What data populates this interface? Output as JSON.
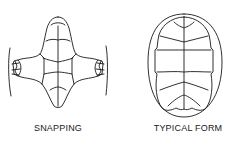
{
  "figure": {
    "panels": [
      {
        "id": "snapping",
        "label": "SNAPPING"
      },
      {
        "id": "typical",
        "label": "TYPICAL FORM"
      }
    ],
    "stroke_color": "#1a1a1a",
    "background": "#ffffff"
  }
}
